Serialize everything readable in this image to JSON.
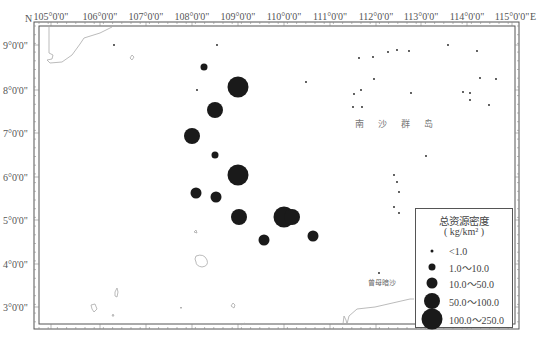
{
  "map": {
    "north_label": "N",
    "east_label": "E",
    "longitude_ticks": [
      {
        "label": "105°0'0\"",
        "x": 51
      },
      {
        "label": "106°0'0\"",
        "x": 100
      },
      {
        "label": "107°0'0\"",
        "x": 146
      },
      {
        "label": "108°0'0\"",
        "x": 192
      },
      {
        "label": "109°0'0\"",
        "x": 238
      },
      {
        "label": "110°0'0\"",
        "x": 284
      },
      {
        "label": "111°0'0\"",
        "x": 330
      },
      {
        "label": "112°0'0\"",
        "x": 376
      },
      {
        "label": "113°0'0\"",
        "x": 421
      },
      {
        "label": "114°0'0\"",
        "x": 467
      },
      {
        "label": "115°0'0\"",
        "x": 512
      }
    ],
    "latitude_ticks": [
      {
        "label": "9°0'0\"",
        "y": 45
      },
      {
        "label": "8°0'0\"",
        "y": 90
      },
      {
        "label": "7°0'0\"",
        "y": 133
      },
      {
        "label": "6°0'0\"",
        "y": 177
      },
      {
        "label": "5°0'0\"",
        "y": 220
      },
      {
        "label": "4°0'0\"",
        "y": 264
      },
      {
        "label": "3°0'0\"",
        "y": 307
      }
    ],
    "place_labels": {
      "nansha": "南沙群岛",
      "zengmu": "曾母暗沙"
    },
    "colors": {
      "frame": "#555555",
      "coastline": "#aaaaaa",
      "marker": "#1a1a1a",
      "text": "#555555"
    }
  },
  "legend": {
    "title": "总资源密度",
    "unit": "( kg/km² )",
    "classes": [
      {
        "label": "<1.0",
        "size": 3
      },
      {
        "label": "1.0～10.0",
        "size": 7
      },
      {
        "label": "10.0～50.0",
        "size": 11
      },
      {
        "label": "50.0～100.0",
        "size": 16
      },
      {
        "label": "100.0～250.0",
        "size": 21
      }
    ]
  },
  "stations": [
    {
      "x": 217,
      "y": 45,
      "class": 0
    },
    {
      "x": 204,
      "y": 67,
      "class": 1
    },
    {
      "x": 238,
      "y": 87,
      "class": 4
    },
    {
      "x": 197,
      "y": 90,
      "class": 0
    },
    {
      "x": 215,
      "y": 110,
      "class": 3
    },
    {
      "x": 192,
      "y": 136,
      "class": 3
    },
    {
      "x": 215,
      "y": 155,
      "class": 1
    },
    {
      "x": 238,
      "y": 175,
      "class": 4
    },
    {
      "x": 196,
      "y": 193,
      "class": 2
    },
    {
      "x": 216,
      "y": 197,
      "class": 2
    },
    {
      "x": 239,
      "y": 217,
      "class": 3
    },
    {
      "x": 284,
      "y": 217,
      "class": 4
    },
    {
      "x": 292,
      "y": 217,
      "class": 3
    },
    {
      "x": 264,
      "y": 240,
      "class": 2
    },
    {
      "x": 313,
      "y": 236,
      "class": 2
    },
    {
      "x": 379,
      "y": 273,
      "class": 0
    },
    {
      "x": 359,
      "y": 58,
      "class": 0
    },
    {
      "x": 373,
      "y": 57,
      "class": 0
    },
    {
      "x": 388,
      "y": 52,
      "class": 0
    },
    {
      "x": 397,
      "y": 50,
      "class": 0
    },
    {
      "x": 409,
      "y": 51,
      "class": 0
    },
    {
      "x": 448,
      "y": 45,
      "class": 0
    },
    {
      "x": 477,
      "y": 51,
      "class": 0
    },
    {
      "x": 306,
      "y": 82,
      "class": 0
    },
    {
      "x": 354,
      "y": 94,
      "class": 0
    },
    {
      "x": 361,
      "y": 90,
      "class": 0
    },
    {
      "x": 362,
      "y": 107,
      "class": 0
    },
    {
      "x": 374,
      "y": 79,
      "class": 0
    },
    {
      "x": 353,
      "y": 107,
      "class": 0
    },
    {
      "x": 411,
      "y": 93,
      "class": 0
    },
    {
      "x": 463,
      "y": 92,
      "class": 0
    },
    {
      "x": 470,
      "y": 93,
      "class": 0
    },
    {
      "x": 470,
      "y": 100,
      "class": 0
    },
    {
      "x": 489,
      "y": 105,
      "class": 0
    },
    {
      "x": 496,
      "y": 79,
      "class": 0
    },
    {
      "x": 480,
      "y": 78,
      "class": 0
    },
    {
      "x": 426,
      "y": 156,
      "class": 0
    },
    {
      "x": 394,
      "y": 175,
      "class": 0
    },
    {
      "x": 397,
      "y": 182,
      "class": 0
    },
    {
      "x": 399,
      "y": 192,
      "class": 0
    },
    {
      "x": 394,
      "y": 207,
      "class": 0
    },
    {
      "x": 399,
      "y": 213,
      "class": 0
    },
    {
      "x": 114,
      "y": 45,
      "class": 0
    }
  ]
}
